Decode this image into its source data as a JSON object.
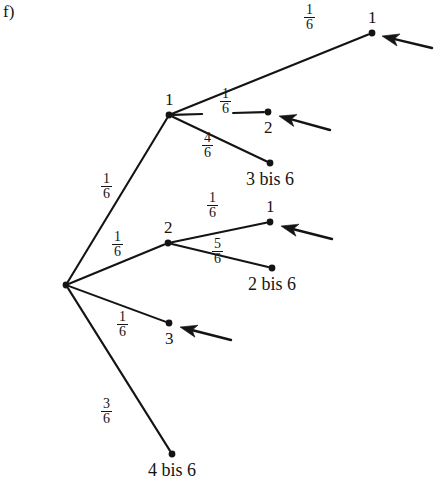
{
  "figure": {
    "part_label": "f)",
    "type": "probability-tree-diagram",
    "background_color": "#ffffff",
    "ink_color": "#141414"
  },
  "nodes": [
    {
      "id": "root",
      "label": "",
      "x": 66,
      "y": 285,
      "label_pos": "none"
    },
    {
      "id": "n1",
      "label": "1",
      "x": 169,
      "y": 115,
      "label_pos": "above"
    },
    {
      "id": "n2",
      "label": "2",
      "x": 168,
      "y": 243,
      "label_pos": "above"
    },
    {
      "id": "n3",
      "label": "3",
      "x": 169,
      "y": 323,
      "label_pos": "below"
    },
    {
      "id": "n4",
      "label": "4 bis 6",
      "x": 172,
      "y": 454,
      "label_pos": "below"
    },
    {
      "id": "n1a",
      "label": "1",
      "x": 372,
      "y": 33,
      "label_pos": "above"
    },
    {
      "id": "n1b",
      "label": "2",
      "x": 268,
      "y": 112,
      "label_pos": "below"
    },
    {
      "id": "n1c",
      "label": "3 bis 6",
      "x": 270,
      "y": 163,
      "label_pos": "below"
    },
    {
      "id": "n2a",
      "label": "1",
      "x": 270,
      "y": 222,
      "label_pos": "above"
    },
    {
      "id": "n2b",
      "label": "2 bis 6",
      "x": 272,
      "y": 268,
      "label_pos": "below"
    }
  ],
  "edges": [
    {
      "from": "root",
      "to": "n1",
      "probability_numerator": "1",
      "probability_denominator": "6",
      "label_x": 110,
      "label_y": 187
    },
    {
      "from": "root",
      "to": "n2",
      "probability_numerator": "1",
      "probability_denominator": "6",
      "label_x": 121,
      "label_y": 245
    },
    {
      "from": "root",
      "to": "n3",
      "probability_numerator": "1",
      "probability_denominator": "6",
      "label_x": 126,
      "label_y": 325
    },
    {
      "from": "root",
      "to": "n4",
      "probability_numerator": "3",
      "probability_denominator": "6",
      "label_x": 110,
      "label_y": 412
    },
    {
      "from": "n1",
      "to": "n1a",
      "probability_numerator": "1",
      "probability_denominator": "6",
      "label_x": 313,
      "label_y": 18
    },
    {
      "from": "n1",
      "to": "n1b",
      "probability_numerator": "1",
      "probability_denominator": "6",
      "label_x": 229,
      "label_y": 102
    },
    {
      "from": "n1",
      "to": "n1c",
      "probability_numerator": "4",
      "probability_denominator": "6",
      "label_x": 211,
      "label_y": 146
    },
    {
      "from": "n2",
      "to": "n2a",
      "probability_numerator": "1",
      "probability_denominator": "6",
      "label_x": 216,
      "label_y": 206
    },
    {
      "from": "n2",
      "to": "n2b",
      "probability_numerator": "5",
      "probability_denominator": "6",
      "label_x": 221,
      "label_y": 252
    }
  ],
  "arrows": [
    {
      "points_at": "n1a",
      "tip_x": 382,
      "tip_y": 36,
      "tail_x": 432,
      "tail_y": 48
    },
    {
      "points_at": "n1b",
      "tip_x": 279,
      "tip_y": 116,
      "tail_x": 330,
      "tail_y": 130
    },
    {
      "points_at": "n2a",
      "tip_x": 281,
      "tip_y": 226,
      "tail_x": 332,
      "tail_y": 239
    },
    {
      "points_at": "n3",
      "tip_x": 180,
      "tip_y": 327,
      "tail_x": 231,
      "tail_y": 340
    }
  ]
}
